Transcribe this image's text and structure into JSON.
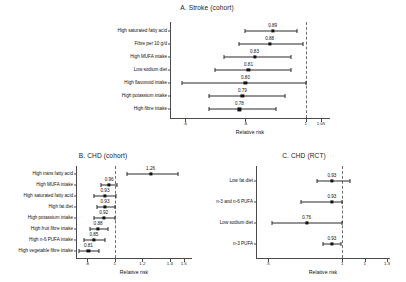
{
  "figure": {
    "background": "#ffffff",
    "marker_color": "#111111",
    "line_color": "#2b2b2b",
    "refline_color": "#6f6f6f",
    "axis_color": "#4a4a4a"
  },
  "chart_data": [
    {
      "id": "panel-a",
      "type": "forest",
      "title": "A. Stroke (cohort)",
      "xlabel": "Relative risk",
      "ylabel": "",
      "xlim": [
        0.55,
        1.08
      ],
      "xticks": [
        0.6,
        0.8,
        1,
        1.05
      ],
      "xticklabels": [
        ".6",
        ".8",
        "1",
        "1.05"
      ],
      "reference_line": 1,
      "grid": false,
      "legend": "none",
      "categories": [
        "High saturated fatty acid",
        "Fibre per 10 g/d",
        "High MUFA intake",
        "Low sodium diet",
        "High flavonoid intake",
        "High potassium intake",
        "High fibre intake"
      ],
      "values": [
        0.89,
        0.88,
        0.83,
        0.81,
        0.8,
        0.79,
        0.78
      ],
      "value_labels": [
        "0.89",
        "0.88",
        "0.83",
        "0.81",
        "0.80",
        "0.79",
        "0.78"
      ],
      "ci_low": [
        0.8,
        0.78,
        0.73,
        0.7,
        0.59,
        0.68,
        0.68
      ],
      "ci_high": [
        0.97,
        0.99,
        0.95,
        0.95,
        1.0,
        0.93,
        0.9
      ]
    },
    {
      "id": "panel-b",
      "type": "forest",
      "title": "B. CHD (cohort)",
      "xlabel": "Relative risk",
      "ylabel": "",
      "xlim": [
        0.72,
        1.56
      ],
      "xticks": [
        0.8,
        1,
        1.2,
        1.4,
        1.5
      ],
      "xticklabels": [
        ".8",
        "1",
        "1.2",
        "1.4",
        "1.5"
      ],
      "reference_line": 1,
      "grid": false,
      "legend": "none",
      "categories": [
        "High trans fatty acid",
        "High MUFA intake",
        "High saturated fatty acid",
        "High fat diet",
        "High potassium intake",
        "High fruit fibre intake",
        "High n-6 PUFA intake",
        "High vegetable fibre intake"
      ],
      "values": [
        1.26,
        0.96,
        0.93,
        0.93,
        0.92,
        0.88,
        0.85,
        0.81
      ],
      "value_labels": [
        "1.26",
        "0.96",
        "0.93",
        "0.93",
        "0.92",
        "0.88",
        "0.85",
        "0.81"
      ],
      "ci_low": [
        1.09,
        0.9,
        0.85,
        0.87,
        0.85,
        0.82,
        0.78,
        0.74
      ],
      "ci_high": [
        1.46,
        1.02,
        1.01,
        1.0,
        1.0,
        0.95,
        0.93,
        0.89
      ]
    },
    {
      "id": "panel-c",
      "type": "forest",
      "title": "C. CHD (RCT)",
      "xlabel": "Relative risk",
      "ylabel": "",
      "xlim": [
        0.42,
        1.32
      ],
      "xticks": [
        0.5,
        1,
        1.15,
        1.3
      ],
      "xticklabels": [
        ".5",
        "1",
        "1",
        "1.3"
      ],
      "reference_line": 1,
      "grid": false,
      "legend": "none",
      "categories": [
        "Low fat diet",
        "n-3 and n-6 PUFA",
        "Low sodium diet",
        "n-3 PUFA"
      ],
      "values": [
        0.93,
        0.93,
        0.76,
        0.93
      ],
      "value_labels": [
        "0.93",
        "0.93",
        "0.76",
        "0.93"
      ],
      "ci_low": [
        0.83,
        0.72,
        0.53,
        0.87
      ],
      "ci_high": [
        1.05,
        1.0,
        1.0,
        0.99
      ]
    }
  ]
}
